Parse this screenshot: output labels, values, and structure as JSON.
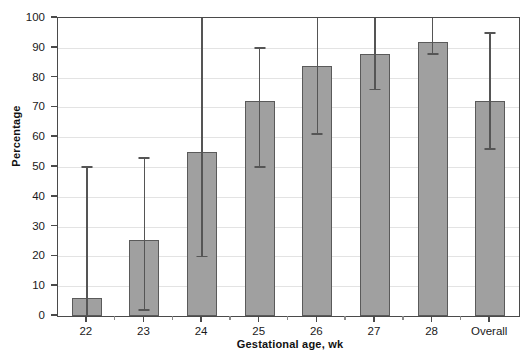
{
  "chart_data": {
    "type": "bar",
    "title": "",
    "xlabel": "Gestational age, wk",
    "ylabel": "Percentage",
    "ylim": [
      0,
      100
    ],
    "ytick_step": 10,
    "yticks": [
      0,
      10,
      20,
      30,
      40,
      50,
      60,
      70,
      80,
      90,
      100
    ],
    "grid": true,
    "legend": null,
    "error_bars": "95% confidence interval",
    "categories": [
      "22",
      "23",
      "24",
      "25",
      "26",
      "27",
      "28",
      "Overall"
    ],
    "values": [
      6,
      25.5,
      55,
      72,
      84,
      88,
      92,
      72
    ],
    "ci_low": [
      0,
      2,
      20,
      50,
      61,
      76,
      88,
      56
    ],
    "ci_high": [
      50,
      53,
      100,
      90,
      100,
      100,
      100,
      95
    ],
    "series": [
      {
        "name": "Percentage",
        "values": [
          6,
          25.5,
          55,
          72,
          84,
          88,
          92,
          72
        ]
      }
    ],
    "bar_color": "#a0a0a0",
    "bar_edge_color": "#5a5a5a",
    "error_color": "#555555",
    "grid_color": "#e3e3e3",
    "axis_color": "#4a4a4a"
  }
}
